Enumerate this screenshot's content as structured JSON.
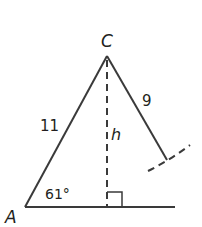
{
  "diagram": {
    "type": "triangle-ambiguous-case",
    "vertices": {
      "top": {
        "label": "C",
        "x": 107,
        "y": 55
      },
      "left": {
        "label": "A",
        "x": 25,
        "y": 207
      }
    },
    "sides": {
      "left_side_label": "11",
      "right_side_label": "9",
      "altitude_label": "h"
    },
    "angle_label": "61°",
    "colors": {
      "stroke": "#3a3a3a",
      "text": "#231f20",
      "background": "#ffffff"
    }
  }
}
